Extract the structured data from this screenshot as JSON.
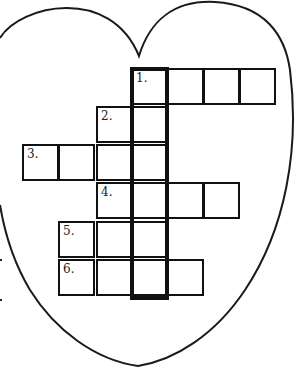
{
  "puzzle": {
    "title": "Heart crossword",
    "shape": "heart",
    "highlight_word": "1",
    "clue_numbers": [
      "1.",
      "2.",
      "3.",
      "4.",
      "5.",
      "6."
    ],
    "cells": [
      {
        "x": 131,
        "y": 68,
        "label": "1."
      },
      {
        "x": 167,
        "y": 68,
        "label": ""
      },
      {
        "x": 203,
        "y": 68,
        "label": ""
      },
      {
        "x": 239,
        "y": 68,
        "label": ""
      },
      {
        "x": 96,
        "y": 106,
        "label": "2."
      },
      {
        "x": 131,
        "y": 106,
        "label": ""
      },
      {
        "x": 22,
        "y": 144,
        "label": "3."
      },
      {
        "x": 58,
        "y": 144,
        "label": ""
      },
      {
        "x": 96,
        "y": 144,
        "label": ""
      },
      {
        "x": 131,
        "y": 144,
        "label": ""
      },
      {
        "x": 96,
        "y": 182,
        "label": "4."
      },
      {
        "x": 131,
        "y": 182,
        "label": ""
      },
      {
        "x": 167,
        "y": 182,
        "label": ""
      },
      {
        "x": 203,
        "y": 182,
        "label": ""
      },
      {
        "x": 58,
        "y": 221,
        "label": "5."
      },
      {
        "x": 96,
        "y": 221,
        "label": ""
      },
      {
        "x": 131,
        "y": 221,
        "label": ""
      },
      {
        "x": 58,
        "y": 259,
        "label": "6."
      },
      {
        "x": 96,
        "y": 259,
        "label": ""
      },
      {
        "x": 131,
        "y": 259,
        "label": ""
      },
      {
        "x": 167,
        "y": 259,
        "label": ""
      }
    ],
    "cell_size": 37,
    "colors": {
      "line": "#111111",
      "background": "#ffffff"
    }
  }
}
